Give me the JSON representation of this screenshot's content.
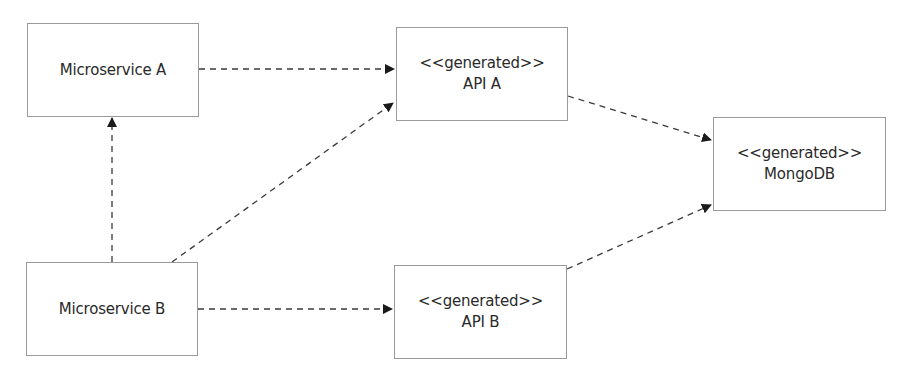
{
  "diagram": {
    "type": "dependency-diagram",
    "nodes": [
      {
        "id": "ms_a",
        "stereotype": "",
        "label": "Microservice A"
      },
      {
        "id": "api_a",
        "stereotype": "<<generated>>",
        "label": "API A"
      },
      {
        "id": "mongodb",
        "stereotype": "<<generated>>",
        "label": "MongoDB"
      },
      {
        "id": "ms_b",
        "stereotype": "",
        "label": "Microservice B"
      },
      {
        "id": "api_b",
        "stereotype": "<<generated>>",
        "label": "API B"
      }
    ],
    "edges": [
      {
        "from": "Microservice A",
        "to": "API A",
        "style": "dashed",
        "arrow": "filled"
      },
      {
        "from": "Microservice B",
        "to": "Microservice A",
        "style": "dashed",
        "arrow": "filled"
      },
      {
        "from": "Microservice B",
        "to": "API A",
        "style": "dashed",
        "arrow": "filled"
      },
      {
        "from": "Microservice B",
        "to": "API B",
        "style": "dashed",
        "arrow": "filled"
      },
      {
        "from": "API A",
        "to": "MongoDB",
        "style": "dashed",
        "arrow": "filled"
      },
      {
        "from": "API B",
        "to": "MongoDB",
        "style": "dashed",
        "arrow": "filled"
      }
    ],
    "colors": {
      "box_border": "#9a9a9a",
      "line": "#3a3a3a",
      "text": "#2a2a2a",
      "background": "#ffffff"
    }
  }
}
